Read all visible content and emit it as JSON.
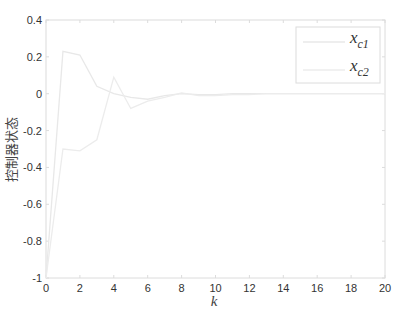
{
  "chart_data": {
    "type": "line",
    "title": "",
    "xlabel": "k",
    "ylabel": "控制器状态",
    "xlim": [
      0,
      20
    ],
    "ylim": [
      -1,
      0.4
    ],
    "xticks": [
      0,
      2,
      4,
      6,
      8,
      10,
      12,
      14,
      16,
      18,
      20
    ],
    "yticks": [
      -1,
      -0.8,
      -0.6,
      -0.4,
      -0.2,
      0,
      0.2,
      0.4
    ],
    "ytick_labels": [
      "-1",
      "-0.8",
      "-0.6",
      "-0.4",
      "-0.2",
      "0",
      "0.2",
      "0.4"
    ],
    "grid": false,
    "legend_position": "upper right",
    "x": [
      0,
      1,
      2,
      3,
      4,
      5,
      6,
      7,
      8,
      9,
      10,
      11,
      12,
      13,
      14,
      15,
      16,
      17,
      18,
      19,
      20
    ],
    "series": [
      {
        "name": "x_c1",
        "label_main": "x",
        "label_sub": "c1",
        "color": "#e8e8e8",
        "values": [
          -1,
          0.23,
          0.21,
          0.04,
          0.0,
          -0.02,
          -0.03,
          -0.01,
          0.0,
          -0.005,
          -0.005,
          0,
          0,
          0,
          0,
          0,
          0,
          0,
          0,
          0,
          0
        ]
      },
      {
        "name": "x_c2",
        "label_main": "x",
        "label_sub": "c2",
        "color": "#ececec",
        "values": [
          -1,
          -0.3,
          -0.31,
          -0.25,
          0.09,
          -0.08,
          -0.04,
          -0.02,
          0.005,
          -0.01,
          -0.01,
          -0.005,
          -0.005,
          0,
          0,
          0,
          0,
          0,
          0,
          0,
          0
        ]
      }
    ]
  },
  "colors": {
    "axis": "#dddddd",
    "tick_text": "#333333",
    "background": "#ffffff"
  }
}
